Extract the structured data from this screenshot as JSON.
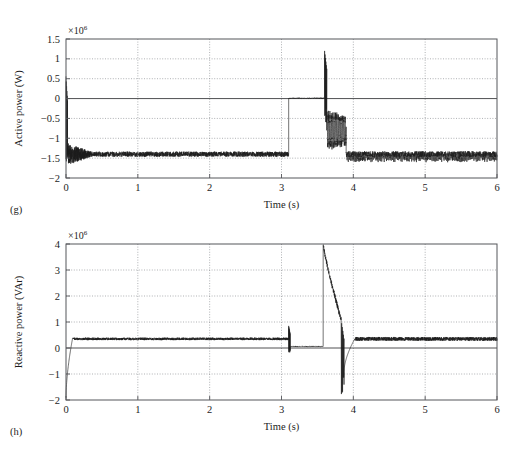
{
  "figure": {
    "name": "active-and-reactive-power-time-series",
    "background": "#ffffff",
    "trace_color": "#1c1c1c",
    "grid_color": "#8d8f93",
    "frame_color": "#55565a"
  },
  "chart_data": [
    {
      "type": "line",
      "panel_label": "(g)",
      "title": "",
      "xlabel": "Time (s)",
      "ylabel": "Active power (W)",
      "y_multiplier_text": "×10",
      "y_multiplier_exponent": "6",
      "y_scale": 1000000,
      "xlim": [
        0,
        6
      ],
      "ylim": [
        -2,
        1.5
      ],
      "xticks": [
        0,
        1,
        2,
        3,
        4,
        5,
        6
      ],
      "xtick_labels": [
        "0",
        "1",
        "2",
        "3",
        "4",
        "5",
        "6"
      ],
      "yticks": [
        -2,
        -1.5,
        -1,
        -0.5,
        0,
        0.5,
        1,
        1.5
      ],
      "ytick_labels": [
        "−2",
        "−1.5",
        "−1",
        "−0.5",
        "0",
        "0.5",
        "1",
        "1.5"
      ],
      "grid": true,
      "grid_x": true,
      "grid_y": true,
      "zero_line": 0,
      "legend": null,
      "series": [
        {
          "name": "Active power",
          "units": "W",
          "description": "Startup transient at t=0, steady generation near -1.4e6 W, grid event at 3.1 s driving power to 0, spike and oscillation at 3.6-3.9 s, then ripple-rich recovery to -1.4e6 W.",
          "segments": [
            {
              "kind": "transient_spike",
              "t_start": 0.0,
              "t_end": 0.02,
              "y_high": 0.55,
              "y_low": -1.85
            },
            {
              "kind": "noisy_decay",
              "t_start": 0.02,
              "t_end": 0.35,
              "y_mean": -1.4,
              "noise_start": 0.28,
              "noise_end": 0.07
            },
            {
              "kind": "noisy_steady",
              "t_start": 0.35,
              "t_end": 3.1,
              "y_mean": -1.4,
              "noise": 0.065
            },
            {
              "kind": "step_flat",
              "t_start": 3.1,
              "t_end": 3.6,
              "y_mean": 0.01,
              "noise": 0.012
            },
            {
              "kind": "transient_spike",
              "t_start": 3.6,
              "t_end": 3.63,
              "y_high": 1.2,
              "y_low": -0.6
            },
            {
              "kind": "oscillation",
              "t_start": 3.63,
              "t_end": 3.9,
              "y_mean": -0.8,
              "amplitude": 0.52,
              "frequency": 52
            },
            {
              "kind": "ripple_steady",
              "t_start": 3.9,
              "t_end": 6.0,
              "y_mean": -1.4,
              "noise": 0.075,
              "ripple_amplitude": 0.13,
              "ripple_frequency": 60
            }
          ]
        }
      ]
    },
    {
      "type": "line",
      "panel_label": "(h)",
      "title": "",
      "xlabel": "Time (s)",
      "ylabel": "Reactive power (VAr)",
      "y_multiplier_text": "×10",
      "y_multiplier_exponent": "6",
      "y_scale": 1000000,
      "xlim": [
        0,
        6
      ],
      "ylim": [
        -2,
        4
      ],
      "xticks": [
        0,
        1,
        2,
        3,
        4,
        5,
        6
      ],
      "xtick_labels": [
        "0",
        "1",
        "2",
        "3",
        "4",
        "5",
        "6"
      ],
      "yticks": [
        -2,
        -1,
        0,
        1,
        2,
        3,
        4
      ],
      "ytick_labels": [
        "−2",
        "−1",
        "0",
        "1",
        "2",
        "3",
        "4"
      ],
      "grid": true,
      "grid_x": true,
      "grid_y": true,
      "zero_line": 0,
      "legend": null,
      "series": [
        {
          "name": "Reactive power",
          "units": "VAr",
          "description": "Rises from -1.9e6 VAr at start to a 0.35e6 VAr steady band, drops to near zero at 3.1 s, spikes to 4e6 VAr at 3.6 s, decays with a dip to -1.8e6 VAr near 3.85 s, then returns to the 0.35e6 VAr band.",
          "segments": [
            {
              "kind": "rise",
              "t_start": 0.0,
              "t_end": 0.09,
              "y_from": -1.9,
              "y_to": 0.35
            },
            {
              "kind": "noisy_steady",
              "t_start": 0.09,
              "t_end": 3.1,
              "y_mean": 0.35,
              "noise": 0.05
            },
            {
              "kind": "transient_spike",
              "t_start": 3.1,
              "t_end": 3.12,
              "y_high": 0.85,
              "y_low": -0.3
            },
            {
              "kind": "step_flat",
              "t_start": 3.12,
              "t_end": 3.58,
              "y_mean": 0.06,
              "noise": 0.018
            },
            {
              "kind": "spike_decay",
              "t_start": 3.58,
              "t_end": 3.83,
              "y_peak": 4.0,
              "y_end": 1.1,
              "noise": 0.09
            },
            {
              "kind": "transient_spike",
              "t_start": 3.83,
              "t_end": 3.87,
              "y_high": 1.1,
              "y_low": -1.85
            },
            {
              "kind": "rise",
              "t_start": 3.87,
              "t_end": 4.02,
              "y_from": -0.9,
              "y_to": 0.35
            },
            {
              "kind": "noisy_steady",
              "t_start": 4.02,
              "t_end": 6.0,
              "y_mean": 0.35,
              "noise": 0.075
            }
          ]
        }
      ]
    }
  ]
}
